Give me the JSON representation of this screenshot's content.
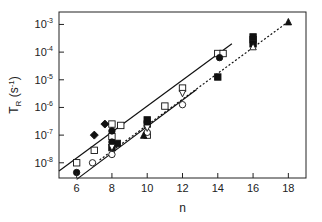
{
  "chart_data": {
    "type": "scatter",
    "title": "",
    "xlabel": "n",
    "ylabel": "T_R (s^-1)",
    "ylabel_parts": {
      "main": "T",
      "sub": "R",
      "unit_open": " (s",
      "unit_sup": "-1",
      "unit_close": ")"
    },
    "xscale": "linear",
    "yscale": "log",
    "xlim": [
      5.0,
      19.0
    ],
    "ylim_log10": [
      -8.55,
      -2.55
    ],
    "xticks": [
      6,
      8,
      10,
      12,
      14,
      16,
      18
    ],
    "yticks_log10": [
      -3,
      -4,
      -5,
      -6,
      -7,
      -8
    ],
    "ytick_labels": [
      "10-3",
      "10-4",
      "10-5",
      "10-6",
      "10-7",
      "10-8"
    ],
    "grid": false,
    "legend": null,
    "series": [
      {
        "name": "open squares",
        "marker": "square-open",
        "points": [
          [
            6.0,
            -8.0
          ],
          [
            7.0,
            -7.55
          ],
          [
            8.0,
            -6.6
          ],
          [
            8.0,
            -7.05
          ],
          [
            8.5,
            -6.65
          ],
          [
            10.0,
            -7.0
          ],
          [
            11.0,
            -5.95
          ],
          [
            12.0,
            -5.3
          ],
          [
            14.0,
            -4.05
          ],
          [
            14.3,
            -4.05
          ],
          [
            16.0,
            -3.55
          ]
        ]
      },
      {
        "name": "filled circles",
        "marker": "circle-filled",
        "points": [
          [
            6.0,
            -8.35
          ],
          [
            8.0,
            -7.25
          ],
          [
            8.0,
            -6.85
          ],
          [
            14.1,
            -4.2
          ]
        ]
      },
      {
        "name": "filled diamonds",
        "marker": "diamond-filled",
        "points": [
          [
            7.0,
            -7.0
          ],
          [
            7.6,
            -6.6
          ]
        ]
      },
      {
        "name": "filled squares",
        "marker": "square-filled",
        "points": [
          [
            8.0,
            -7.45
          ],
          [
            8.3,
            -7.3
          ],
          [
            10.0,
            -6.45
          ],
          [
            10.0,
            -6.6
          ],
          [
            14.0,
            -4.9
          ],
          [
            16.0,
            -3.45
          ],
          [
            16.0,
            -3.7
          ]
        ]
      },
      {
        "name": "open circles",
        "marker": "circle-open",
        "points": [
          [
            6.9,
            -8.0
          ],
          [
            8.0,
            -7.7
          ],
          [
            10.0,
            -6.9
          ],
          [
            12.0,
            -5.9
          ]
        ]
      },
      {
        "name": "open down-triangles",
        "marker": "triangle-down-open",
        "points": [
          [
            8.0,
            -7.45
          ],
          [
            10.0,
            -6.75
          ],
          [
            12.0,
            -5.5
          ]
        ]
      },
      {
        "name": "open triangles",
        "marker": "triangle-open",
        "points": [
          [
            16.0,
            -3.8
          ]
        ]
      },
      {
        "name": "filled triangles",
        "marker": "triangle-filled",
        "points": [
          [
            18.0,
            -2.9
          ],
          [
            9.8,
            -7.0
          ]
        ]
      }
    ],
    "fit_lines": [
      {
        "name": "upper solid fit",
        "style": "solid",
        "from": [
          5.0,
          -8.3
        ],
        "to": [
          14.8,
          -3.7
        ]
      },
      {
        "name": "dotted fit",
        "style": "dotted",
        "from": [
          7.3,
          -7.9
        ],
        "to": [
          18.0,
          -2.9
        ]
      },
      {
        "name": "lower solid fit",
        "style": "solid",
        "from": [
          6.0,
          -8.6
        ],
        "to": [
          12.8,
          -5.35
        ]
      }
    ]
  }
}
